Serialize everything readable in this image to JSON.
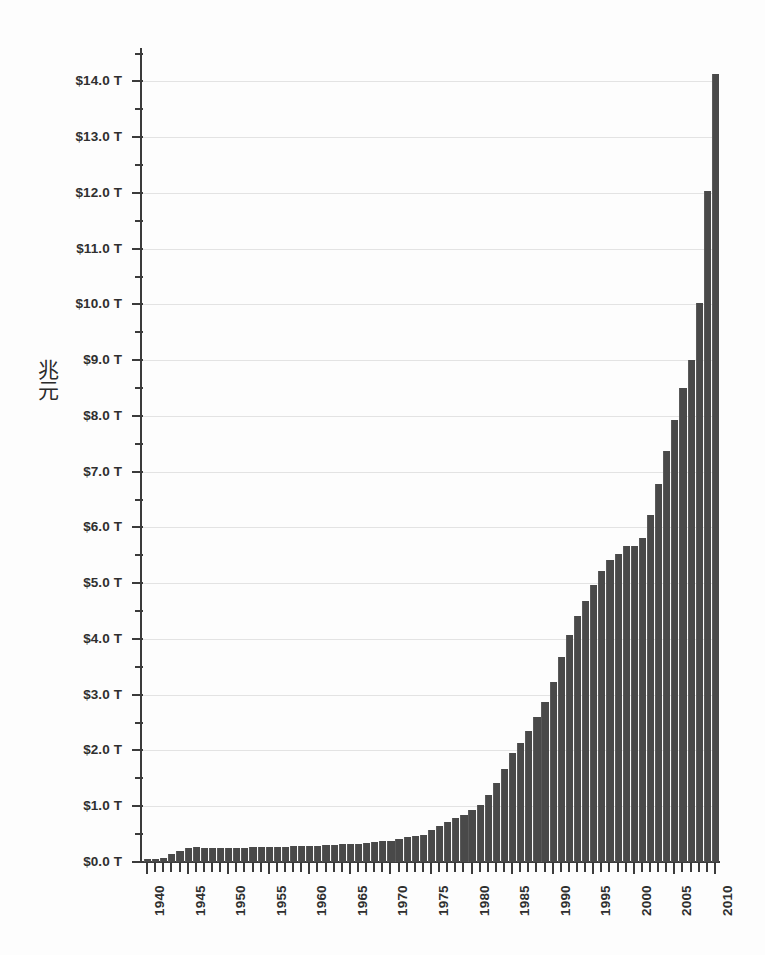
{
  "chart_data": {
    "type": "bar",
    "title": "",
    "xlabel": "",
    "ylabel": "兆元",
    "ylim": [
      0,
      14.6
    ],
    "xlim": [
      1939.5,
      2010.5
    ],
    "grid": true,
    "legend": "none",
    "y_tick_format": "$%.1f T",
    "y_major_step": 1.0,
    "y_minor_step": 0.5,
    "x_tick_step": 1,
    "x_label_step": 5,
    "bar_color": "#494949",
    "gridline_color": "#e3e3e3",
    "axis_color": "#3b3b3b",
    "background_color": "#fdfdfd",
    "y_ticklabels": [
      "$0.0 T",
      "$1.0 T",
      "$2.0 T",
      "$3.0 T",
      "$4.0 T",
      "$5.0 T",
      "$6.0 T",
      "$7.0 T",
      "$8.0 T",
      "$9.0 T",
      "$10.0 T",
      "$11.0 T",
      "$12.0 T",
      "$13.0 T",
      "$14.0 T"
    ],
    "y_tickvalues": [
      0,
      1,
      2,
      3,
      4,
      5,
      6,
      7,
      8,
      9,
      10,
      11,
      12,
      13,
      14
    ],
    "x_ticklabels": [
      "1940",
      "1945",
      "1950",
      "1955",
      "1960",
      "1965",
      "1970",
      "1975",
      "1980",
      "1985",
      "1990",
      "1995",
      "2000",
      "2005",
      "2010"
    ],
    "x_tickvalues": [
      1940,
      1945,
      1950,
      1955,
      1960,
      1965,
      1970,
      1975,
      1980,
      1985,
      1990,
      1995,
      2000,
      2005,
      2010
    ],
    "categories": [
      1940,
      1941,
      1942,
      1943,
      1944,
      1945,
      1946,
      1947,
      1948,
      1949,
      1950,
      1951,
      1952,
      1953,
      1954,
      1955,
      1956,
      1957,
      1958,
      1959,
      1960,
      1961,
      1962,
      1963,
      1964,
      1965,
      1966,
      1967,
      1968,
      1969,
      1970,
      1971,
      1972,
      1973,
      1974,
      1975,
      1976,
      1977,
      1978,
      1979,
      1980,
      1981,
      1982,
      1983,
      1984,
      1985,
      1986,
      1987,
      1988,
      1989,
      1990,
      1991,
      1992,
      1993,
      1994,
      1995,
      1996,
      1997,
      1998,
      1999,
      2000,
      2001,
      2002,
      2003,
      2004,
      2005,
      2006,
      2007,
      2008,
      2009,
      2010
    ],
    "values": [
      0.05,
      0.06,
      0.08,
      0.14,
      0.2,
      0.26,
      0.27,
      0.26,
      0.25,
      0.25,
      0.26,
      0.26,
      0.26,
      0.27,
      0.27,
      0.27,
      0.27,
      0.27,
      0.28,
      0.28,
      0.29,
      0.29,
      0.3,
      0.31,
      0.32,
      0.32,
      0.33,
      0.34,
      0.36,
      0.37,
      0.38,
      0.41,
      0.44,
      0.47,
      0.49,
      0.58,
      0.65,
      0.72,
      0.79,
      0.85,
      0.93,
      1.03,
      1.2,
      1.41,
      1.66,
      1.95,
      2.13,
      2.35,
      2.6,
      2.87,
      3.23,
      3.67,
      4.07,
      4.41,
      4.69,
      4.97,
      5.22,
      5.41,
      5.53,
      5.66,
      5.67,
      5.81,
      6.23,
      6.78,
      7.38,
      7.93,
      8.51,
      9.01,
      10.02,
      12.04,
      14.13
    ],
    "units": "trillions",
    "currency_symbol": "$",
    "n_bars": 71
  }
}
